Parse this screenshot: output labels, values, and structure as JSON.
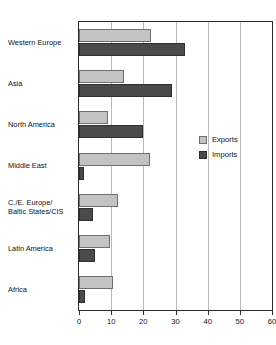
{
  "top_fragment": "",
  "legend": {
    "items": [
      {
        "label": "Exports",
        "color": "#c3c3c3",
        "name": "exports"
      },
      {
        "label": "Imports",
        "color": "#4a4a4a",
        "name": "imports"
      }
    ]
  },
  "chart_data": {
    "type": "bar",
    "orientation": "horizontal",
    "title": "",
    "subtitle": "",
    "xlabel": "",
    "ylabel": "",
    "xlim": [
      0,
      60
    ],
    "xticks": [
      0,
      10,
      20,
      30,
      40,
      50,
      60
    ],
    "xtick_labels": [
      "0",
      "10",
      "20",
      "30",
      "40",
      "50",
      "60"
    ],
    "grid": true,
    "grid_axis": "x",
    "legend_position": "right-middle",
    "categories": [
      "Western Europe",
      "Asia",
      "North America",
      "Middle East",
      "C./E. Europe/ Baltic States/CIS",
      "Latin America",
      "Africa"
    ],
    "category_label_lines": [
      [
        "Western Europe"
      ],
      [
        "Asia"
      ],
      [
        "North America"
      ],
      [
        "Middle East"
      ],
      [
        "C./E. Europe/",
        "Baltic States/CIS"
      ],
      [
        "Latin America"
      ],
      [
        "Africa"
      ]
    ],
    "series": [
      {
        "name": "Exports",
        "color": "#c3c3c3",
        "values": [
          22.5,
          14,
          9,
          22,
          12,
          9.5,
          10.5
        ]
      },
      {
        "name": "Imports",
        "color": "#4a4a4a",
        "values": [
          33,
          29,
          20,
          1.5,
          4.5,
          5,
          2
        ]
      }
    ]
  }
}
